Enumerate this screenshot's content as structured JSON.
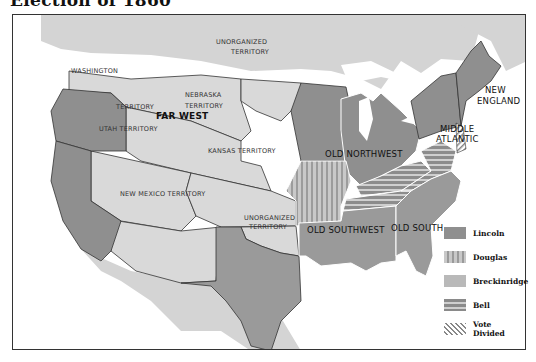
{
  "title": "Election of 1860",
  "map": {
    "regions": [
      {
        "name": "WASHINGTON",
        "line2": "TERRITORY"
      },
      {
        "name": "NEBRASKA",
        "line2": "TERRITORY"
      },
      {
        "name": "UNORGANIZED",
        "line2": "TERRITORY"
      },
      {
        "name": "UTAH TERRITORY"
      },
      {
        "name": "FAR WEST"
      },
      {
        "name": "KANSAS TERRITORY"
      },
      {
        "name": "NEW MEXICO TERRITORY"
      },
      {
        "name": "UNORGANIZED",
        "line2": "TERRITORY"
      },
      {
        "name": "OLD NORTHWEST"
      },
      {
        "name": "MIDDLE",
        "line2": "ATLANTIC"
      },
      {
        "name": "NEW",
        "line2": "ENGLAND"
      },
      {
        "name": "OLD SOUTHWEST"
      },
      {
        "name": "OLD SOUTH"
      }
    ]
  },
  "legend": {
    "items": [
      {
        "label": "Lincoln",
        "color": "#8f8f8f",
        "pattern": "solid-dark"
      },
      {
        "label": "Douglas",
        "color": "#b0b0b0",
        "pattern": "vertical-stripes"
      },
      {
        "label": "Breckinridge",
        "color": "#b9b9b9",
        "pattern": "solid-light"
      },
      {
        "label": "Bell",
        "color": "#8a8a8a",
        "pattern": "horizontal-stripes"
      },
      {
        "label": "Vote",
        "label2": "Divided",
        "color": "#888888",
        "pattern": "diagonal-hatch"
      }
    ]
  }
}
